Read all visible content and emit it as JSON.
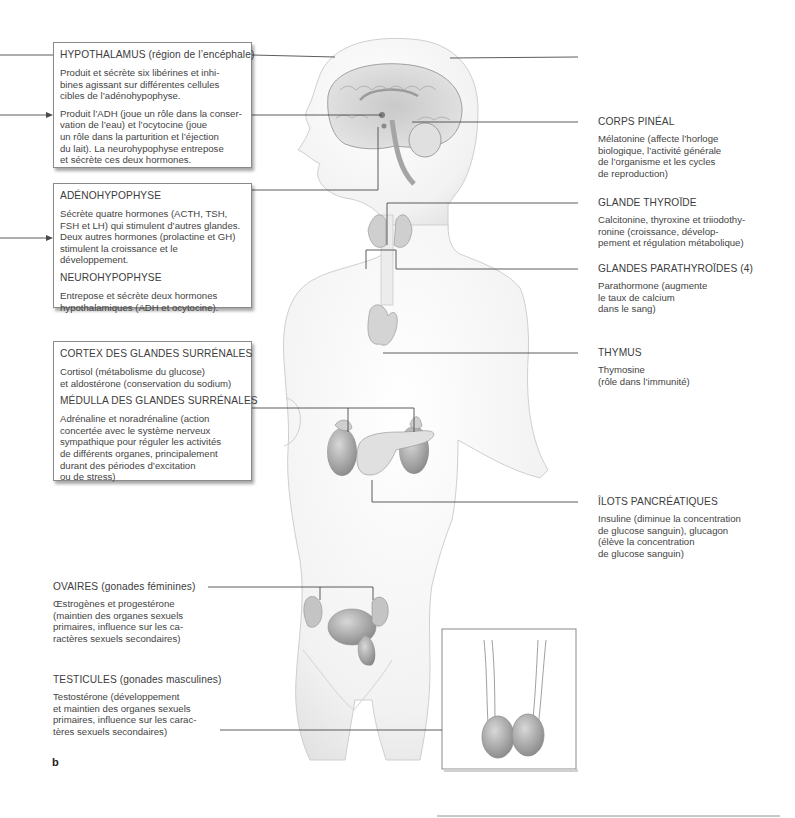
{
  "figure": {
    "panel_letter": "b"
  },
  "left_labels": {
    "hypothalamus": {
      "title": "HYPOTHALAMUS (région de l’encéphale)",
      "text1": "Produit et sécrète six libérines et inhi-\nbines agissant sur différentes cellules\ncibles de l’adénohypophyse.",
      "text2": "Produit l’ADH (joue un rôle dans la conser-\nvation de l’eau) et l’ocytocine (joue\nun rôle dans la parturition et l’éjection\ndu lait). La neurohypophyse entrepose\net sécrète ces deux hormones."
    },
    "hypophysis": {
      "title1": "ADÉNOHYPOPHYSE",
      "text1": "Sécrète quatre hormones (ACTH, TSH,\nFSH et LH) qui stimulent d’autres glandes.\nDeux autres hormones (prolactine et GH)\nstimulent la croissance et le développement.",
      "title2": "NEUROHYPOPHYSE",
      "text2": "Entrepose et sécrète deux hormones\nhypothalamiques (ADH et ocytocine)."
    },
    "adrenal": {
      "title1": "CORTEX DES GLANDES SURRÉNALES",
      "text1": "Cortisol (métabolisme du glucose)\net aldostérone (conservation du sodium)",
      "title2": "MÉDULLA DES GLANDES SURRÉNALES",
      "text2": "Adrénaline et noradrénaline (action\nconcertée avec le système nerveux\nsympathique pour réguler les activités\nde différents organes, principalement\ndurant des périodes d’excitation\nou de stress)"
    },
    "ovaries": {
      "title": "OVAIRES (gonades féminines)",
      "text": "Œstrogènes et progestérone\n(maintien des organes sexuels\nprimaires, influence sur les ca-\nractères sexuels secondaires)"
    },
    "testes": {
      "title": "TESTICULES (gonades masculines)",
      "text": "Testostérone (développement\net maintien des organes sexuels\nprimaires, influence sur les carac-\ntères sexuels secondaires)"
    }
  },
  "right_labels": {
    "pineal": {
      "title": "CORPS PINÉAL",
      "text": "Mélatonine (affecte l’horloge\nbiologique, l’activité générale\nde l’organisme et les cycles\nde reproduction)"
    },
    "thyroid": {
      "title": "GLANDE THYROÏDE",
      "text": "Calcitonine, thyroxine et triiodothy-\nronine (croissance, dévelop-\npement et régulation métabolique)"
    },
    "parathyroid": {
      "title": "GLANDES PARATHYROÏDES (4)",
      "text": "Parathormone (augmente\nle taux de calcium\ndans le sang)"
    },
    "thymus": {
      "title": "THYMUS",
      "text": "Thymosine\n(rôle dans l’immunité)"
    },
    "pancreas": {
      "title": "ÎLOTS PANCRÉATIQUES",
      "text": "Insuline (diminue la concentration\nde glucose sanguin), glucagon\n(élève la concentration\nde glucose sanguin)"
    }
  },
  "colors": {
    "line": "#4a4a4a",
    "body_fill": "#f1f1f1",
    "body_stroke": "#bdbdbd",
    "organ": "#9c9c9c",
    "text": "#3d3d3d"
  }
}
